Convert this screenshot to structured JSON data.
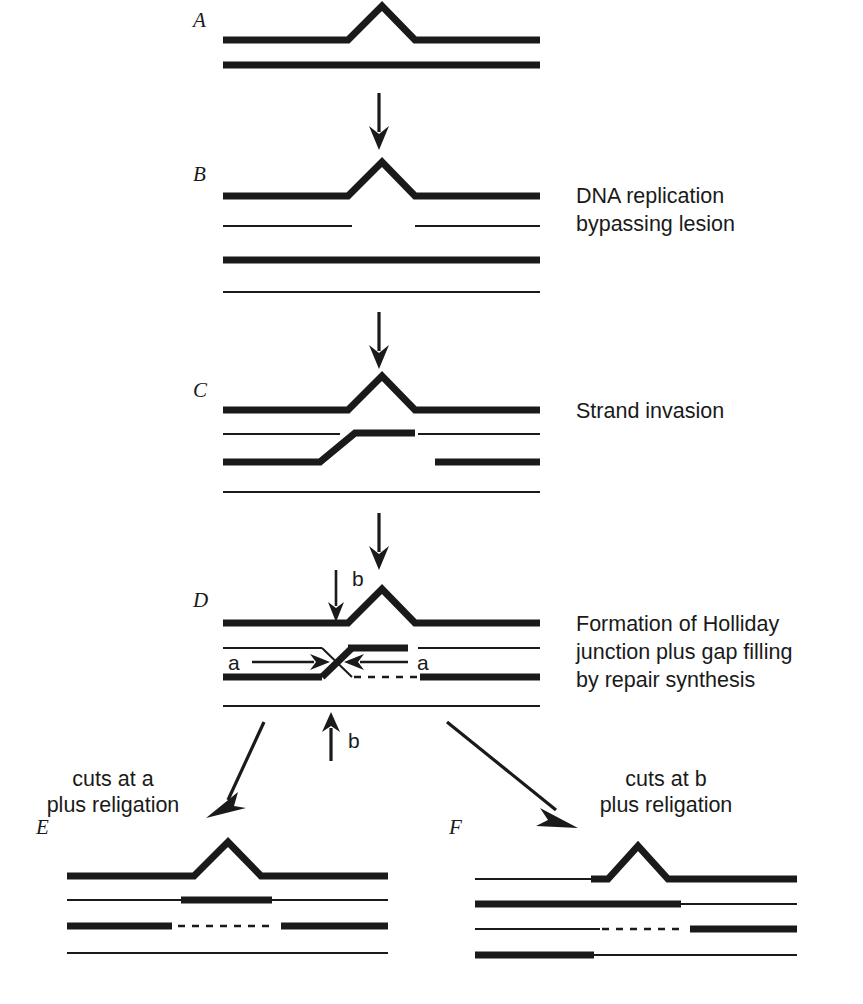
{
  "figure": {
    "title_letters": [
      "A",
      "B",
      "C",
      "D",
      "E",
      "F"
    ],
    "annotations": {
      "b_step": [
        "DNA replication",
        "bypassing lesion"
      ],
      "c_step": [
        "Strand invasion"
      ],
      "d_step": [
        "Formation of Holliday",
        "junction plus gap filling",
        "by repair synthesis"
      ],
      "left_branch": [
        "cuts at a",
        "plus religation"
      ],
      "right_branch": [
        "cuts at b",
        "plus religation"
      ]
    },
    "cut_labels": {
      "a_left": "a",
      "a_right": "a",
      "b_top": "b",
      "b_bottom": "b"
    },
    "colors": {
      "ink": "#1a1a1a",
      "background": "#ffffff"
    },
    "panels": [
      {
        "letter": "A",
        "label_x": 193,
        "label_y": 24,
        "strands": [
          {
            "name": "parental-top-lesion-strand",
            "kind": "thick-peak",
            "y": 40,
            "x1": 223,
            "x2": 540,
            "peak_x": 382,
            "peak_y": 5,
            "rise_x1": 348,
            "rise_x2": 415
          },
          {
            "name": "parental-bottom-strand",
            "kind": "thick",
            "y": 65,
            "x1": 223,
            "x2": 540
          }
        ]
      },
      {
        "letter": "B",
        "label_x": 193,
        "label_y": 178,
        "strands": [
          {
            "name": "parental-top-lesion-strand",
            "kind": "thick-peak",
            "y": 196,
            "x1": 223,
            "x2": 540,
            "peak_x": 382,
            "peak_y": 161,
            "rise_x1": 348,
            "rise_x2": 415
          },
          {
            "name": "daughter-strand-with-gap-left",
            "kind": "thin",
            "y": 226,
            "x1": 223,
            "x2": 352
          },
          {
            "name": "daughter-strand-with-gap-right",
            "kind": "thin",
            "y": 226,
            "x1": 415,
            "x2": 540
          },
          {
            "name": "sister-bottom-thick-strand",
            "kind": "thick",
            "y": 260,
            "x1": 223,
            "x2": 540
          },
          {
            "name": "sister-bottom-thin-strand",
            "kind": "thin",
            "y": 292,
            "x1": 223,
            "x2": 540
          }
        ]
      },
      {
        "letter": "C",
        "label_x": 193,
        "label_y": 394,
        "strands": [
          {
            "name": "parental-top-lesion-strand",
            "kind": "thick-peak",
            "y": 410,
            "x1": 223,
            "x2": 540,
            "peak_x": 382,
            "peak_y": 375,
            "rise_x1": 348,
            "rise_x2": 415
          },
          {
            "name": "invading-thin-strand-left",
            "kind": "thin",
            "y": 434,
            "x1": 223,
            "x2": 340
          },
          {
            "name": "invading-thin-strand-right",
            "kind": "thin",
            "y": 434,
            "x1": 418,
            "x2": 540
          },
          {
            "name": "invading-thick-strand",
            "kind": "thick-step-up",
            "y_low": 462,
            "y_high": 433,
            "x1": 223,
            "step_x1": 320,
            "step_x2": 355,
            "x2": 415
          },
          {
            "name": "sister-thick-strand-right",
            "kind": "thick",
            "y": 462,
            "x1": 435,
            "x2": 540
          },
          {
            "name": "sister-bottom-thin-strand",
            "kind": "thin",
            "y": 492,
            "x1": 223,
            "x2": 540
          }
        ]
      },
      {
        "letter": "D",
        "label_x": 193,
        "label_y": 604,
        "strands": [
          {
            "name": "parental-top-lesion-strand",
            "kind": "thick-peak",
            "y": 623,
            "x1": 223,
            "x2": 540,
            "peak_x": 382,
            "peak_y": 588,
            "rise_x1": 348,
            "rise_x2": 415
          },
          {
            "name": "holliday-thin-arm-left",
            "kind": "thin",
            "y": 648,
            "x1": 223,
            "x2": 322
          },
          {
            "name": "holliday-thin-arm-right",
            "kind": "thin",
            "y": 648,
            "x1": 418,
            "x2": 540
          },
          {
            "name": "holliday-thick-arm-upper-right",
            "kind": "thick",
            "y": 648,
            "x1": 348,
            "x2": 408
          },
          {
            "name": "holliday-thick-arm-lower-left",
            "kind": "thick",
            "y": 677,
            "x1": 223,
            "x2": 322
          },
          {
            "name": "holliday-crossover-thick",
            "kind": "cross-thick",
            "x1": 322,
            "y1": 677,
            "x2": 352,
            "y2": 648
          },
          {
            "name": "holliday-crossover-thin",
            "kind": "cross-thin",
            "x1": 322,
            "y1": 648,
            "x2": 352,
            "y2": 677
          },
          {
            "name": "gap-fill-dashed-segment",
            "kind": "dashed",
            "y": 677,
            "x1": 352,
            "x2": 420
          },
          {
            "name": "holliday-thick-arm-lower-right",
            "kind": "thick",
            "y": 677,
            "x1": 420,
            "x2": 540
          },
          {
            "name": "sister-bottom-thin-strand",
            "kind": "thin",
            "y": 706,
            "x1": 223,
            "x2": 540
          }
        ]
      },
      {
        "letter": "E",
        "label_x": 36,
        "label_y": 831,
        "strands": [
          {
            "name": "product-top-lesion-strand",
            "kind": "thick-peak",
            "y": 876,
            "x1": 67,
            "x2": 388,
            "peak_x": 228,
            "peak_y": 841,
            "rise_x1": 194,
            "rise_x2": 261
          },
          {
            "name": "product-thin-strand-left",
            "kind": "thin",
            "y": 900,
            "x1": 67,
            "x2": 181
          },
          {
            "name": "product-thick-patch",
            "kind": "thick",
            "y": 900,
            "x1": 181,
            "x2": 272
          },
          {
            "name": "product-thin-strand-right",
            "kind": "thin",
            "y": 900,
            "x1": 272,
            "x2": 388
          },
          {
            "name": "product-thick-strand-left",
            "kind": "thick",
            "y": 926,
            "x1": 67,
            "x2": 172
          },
          {
            "name": "product-dashed-gap",
            "kind": "dashed",
            "y": 926,
            "x1": 176,
            "x2": 276
          },
          {
            "name": "product-thick-strand-right",
            "kind": "thick",
            "y": 926,
            "x1": 281,
            "x2": 388
          },
          {
            "name": "product-bottom-thin-strand",
            "kind": "thin",
            "y": 953,
            "x1": 67,
            "x2": 388
          }
        ]
      },
      {
        "letter": "F",
        "label_x": 449,
        "label_y": 831,
        "strands": [
          {
            "name": "product-thin-strand-left-top",
            "kind": "thin",
            "y": 879,
            "x1": 475,
            "x2": 591
          },
          {
            "name": "product-top-lesion-strand",
            "kind": "thick-peak",
            "y": 879,
            "x1": 591,
            "x2": 797,
            "peak_x": 638,
            "peak_y": 845,
            "rise_x1": 608,
            "rise_x2": 668
          },
          {
            "name": "product-thick-strand-second",
            "kind": "thick",
            "y": 904,
            "x1": 475,
            "x2": 681
          },
          {
            "name": "product-thin-strand-second",
            "kind": "thin",
            "y": 904,
            "x1": 681,
            "x2": 797
          },
          {
            "name": "product-thin-strand-third",
            "kind": "thin",
            "y": 929,
            "x1": 475,
            "x2": 597
          },
          {
            "name": "product-dashed-gap",
            "kind": "dashed",
            "y": 929,
            "x1": 600,
            "x2": 688
          },
          {
            "name": "product-thick-strand-third",
            "kind": "thick",
            "y": 929,
            "x1": 690,
            "x2": 797
          },
          {
            "name": "product-thick-strand-bottom",
            "kind": "thick",
            "y": 955,
            "x1": 475,
            "x2": 594
          },
          {
            "name": "product-thin-strand-bottom",
            "kind": "thin",
            "y": 955,
            "x1": 594,
            "x2": 797
          }
        ]
      }
    ],
    "flow_arrows": [
      {
        "name": "arrow-a-to-b",
        "x1": 379,
        "y1": 93,
        "x2": 379,
        "y2": 146
      },
      {
        "name": "arrow-b-to-c",
        "x1": 379,
        "y1": 312,
        "x2": 379,
        "y2": 365
      },
      {
        "name": "arrow-c-to-d",
        "x1": 379,
        "y1": 513,
        "x2": 379,
        "y2": 566
      },
      {
        "name": "arrow-d-to-e",
        "x1": 264,
        "y1": 722,
        "x2": 222,
        "y2": 812
      },
      {
        "name": "arrow-d-to-f",
        "x1": 447,
        "y1": 722,
        "x2": 566,
        "y2": 818
      }
    ],
    "cut_arrows": [
      {
        "name": "cut-arrow-b-top",
        "x1": 336,
        "y1": 570,
        "x2": 336,
        "y2": 622
      },
      {
        "name": "cut-arrow-b-bottom",
        "x1": 331,
        "y1": 761,
        "x2": 331,
        "y2": 714
      },
      {
        "name": "cut-arrow-a-left",
        "x1": 252,
        "y1": 662,
        "x2": 326,
        "y2": 662
      },
      {
        "name": "cut-arrow-a-right",
        "x1": 408,
        "y1": 662,
        "x2": 348,
        "y2": 662
      }
    ]
  }
}
